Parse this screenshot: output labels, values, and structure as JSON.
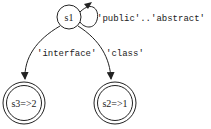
{
  "diagram": {
    "type": "state-machine",
    "nodes": [
      {
        "id": "s1",
        "label": "s1",
        "accepting": false
      },
      {
        "id": "s3",
        "label": "s3=>2",
        "accepting": true
      },
      {
        "id": "s2",
        "label": "s2=>1",
        "accepting": true
      }
    ],
    "edges": [
      {
        "from": "s1",
        "to": "s1",
        "label": "'public'..'abstract'"
      },
      {
        "from": "s1",
        "to": "s3",
        "label": "'interface'"
      },
      {
        "from": "s1",
        "to": "s2",
        "label": "'class'"
      }
    ]
  }
}
